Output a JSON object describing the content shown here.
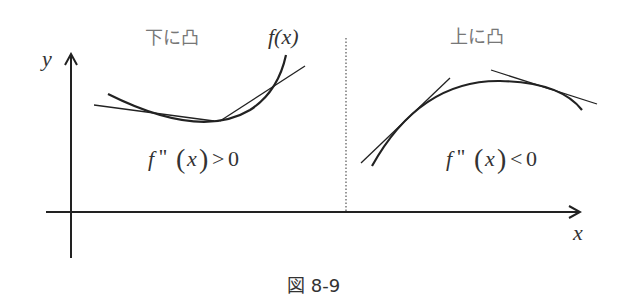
{
  "figure": {
    "caption": "図 8-9",
    "axes": {
      "x_label": "x",
      "y_label": "y"
    },
    "left_panel": {
      "title": "下に凸",
      "function_label": "f(x)",
      "condition": "f''(x) > 0",
      "condition_parts": {
        "f": "f",
        "primes": "''",
        "open": "(",
        "var": "x",
        "close": ")",
        "rel": ">",
        "val": "0"
      }
    },
    "right_panel": {
      "title": "上に凸",
      "condition": "f''(x) < 0",
      "condition_parts": {
        "f": "f",
        "primes": "''",
        "open": "(",
        "var": "x",
        "close": ")",
        "rel": "<",
        "val": "0"
      }
    },
    "line_color": "#222222",
    "label_color": "#777777"
  }
}
